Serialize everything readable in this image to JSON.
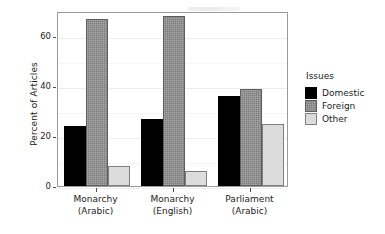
{
  "chart_data": {
    "type": "bar",
    "title": "",
    "xlabel": "",
    "ylabel": "Percent of Articles",
    "ylim": [
      0,
      70
    ],
    "yticks": [
      0,
      20,
      40,
      60
    ],
    "ytick_labels": [
      "0",
      "20",
      "40",
      "60"
    ],
    "grid": true,
    "legend_position": "right",
    "legend_title": "Issues",
    "categories": [
      "Monarchy (Arabic)",
      "Monarchy (English)",
      "Parliament (Arabic)"
    ],
    "category_lines": [
      [
        "Monarchy",
        "(Arabic)"
      ],
      [
        "Monarchy",
        "(English)"
      ],
      [
        "Parliament",
        "(Arabic)"
      ]
    ],
    "series": [
      {
        "name": "Domestic",
        "color": "#000000",
        "values": [
          24,
          27,
          36
        ]
      },
      {
        "name": "Foreign",
        "color": "#7d7d7d",
        "values": [
          67,
          68,
          39
        ]
      },
      {
        "name": "Other",
        "color": "#dcdcdc",
        "values": [
          8,
          6,
          25
        ]
      }
    ]
  },
  "axis": {
    "y_title": "Percent of Articles"
  },
  "legend": {
    "title": "Issues",
    "items": [
      {
        "label": "Domestic",
        "key": "domestic"
      },
      {
        "label": "Foreign",
        "key": "foreign"
      },
      {
        "label": "Other",
        "key": "other"
      }
    ]
  }
}
